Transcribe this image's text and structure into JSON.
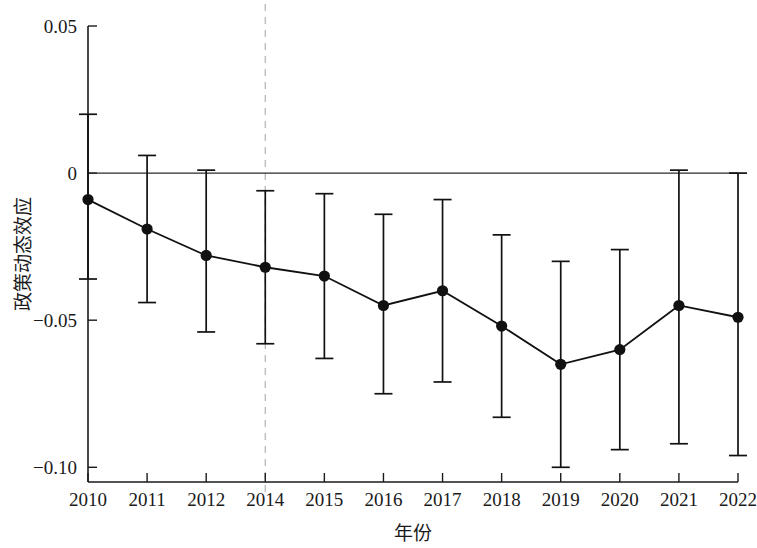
{
  "chart_data": {
    "type": "line",
    "title": "",
    "xlabel": "年份",
    "ylabel": "政策动态效应",
    "x": [
      "2010",
      "2011",
      "2012",
      "2014",
      "2015",
      "2016",
      "2017",
      "2018",
      "2019",
      "2020",
      "2021",
      "2022"
    ],
    "categories": [
      "2010",
      "2011",
      "2012",
      "2014",
      "2015",
      "2016",
      "2017",
      "2018",
      "2019",
      "2020",
      "2021",
      "2022"
    ],
    "values": [
      -0.009,
      -0.019,
      -0.028,
      -0.032,
      -0.035,
      -0.045,
      -0.04,
      -0.052,
      -0.065,
      -0.06,
      -0.045,
      -0.049
    ],
    "series": [
      {
        "name": "政策动态效应",
        "values": [
          -0.009,
          -0.019,
          -0.028,
          -0.032,
          -0.035,
          -0.045,
          -0.04,
          -0.052,
          -0.065,
          -0.06,
          -0.045,
          -0.049
        ],
        "ci_lower": [
          -0.036,
          -0.044,
          -0.054,
          -0.058,
          -0.063,
          -0.075,
          -0.071,
          -0.083,
          -0.1,
          -0.094,
          -0.092,
          -0.096
        ],
        "ci_upper": [
          0.02,
          0.006,
          0.001,
          -0.006,
          -0.007,
          -0.014,
          -0.009,
          -0.021,
          -0.03,
          -0.026,
          0.001,
          0.0
        ]
      }
    ],
    "ylim": [
      -0.105,
      0.05
    ],
    "xlim": [
      2009.6,
      2022.4
    ],
    "yticks": [
      0.05,
      0,
      -0.05,
      -0.1
    ],
    "ytick_labels": [
      "0.05",
      "0",
      "−0.05",
      "−0.10"
    ],
    "xtick_labels": [
      "2010",
      "2011",
      "2012",
      "2014",
      "2015",
      "2016",
      "2017",
      "2018",
      "2019",
      "2020",
      "2021",
      "2022"
    ],
    "grid": false,
    "legend": null,
    "annotations": [
      {
        "type": "hline",
        "y": 0,
        "style": "solid",
        "color": "#2b2b2b",
        "name": "zero-reference-line"
      },
      {
        "type": "vline",
        "x": "2014",
        "style": "dashed",
        "color": "#b8b8b8",
        "name": "policy-year-reference-line"
      }
    ],
    "marker_style": "filled-circle",
    "error_bar_style": "capped-vertical"
  }
}
